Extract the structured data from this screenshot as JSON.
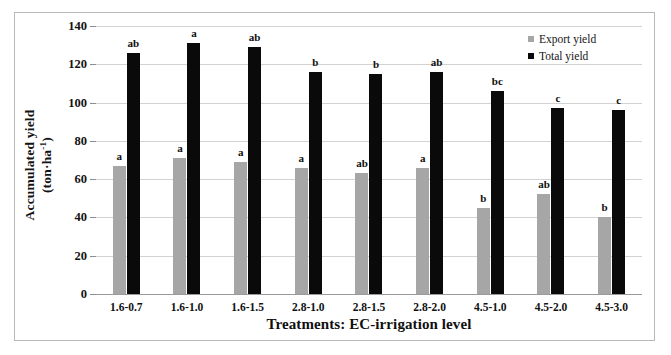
{
  "chart_data": {
    "type": "bar",
    "title": "",
    "xlabel": "Treatments: EC-irrigation level",
    "ylabel_line1": "Accumulated yield",
    "ylabel_line2": "(ton·ha",
    "ylabel_exp": "-1",
    "ylabel_line2_close": ")",
    "categories": [
      "1.6-0.7",
      "1.6-1.0",
      "1.6-1.5",
      "2.8-1.0",
      "2.8-1.5",
      "2.8-2.0",
      "4.5-1.0",
      "4.5-2.0",
      "4.5-3.0"
    ],
    "series": [
      {
        "name": "Export yield",
        "color": "#a6a6a6",
        "values": [
          67,
          71,
          69,
          66,
          63,
          66,
          45,
          52,
          40
        ],
        "letters": [
          "a",
          "a",
          "a",
          "a",
          "ab",
          "a",
          "b",
          "ab",
          "b"
        ]
      },
      {
        "name": "Total yield",
        "color": "#0a0a0a",
        "values": [
          126,
          131,
          129,
          116,
          115,
          116,
          106,
          97,
          96
        ],
        "letters": [
          "ab",
          "a",
          "ab",
          "b",
          "b",
          "ab",
          "bc",
          "c",
          "c"
        ]
      }
    ],
    "yticks": [
      0,
      20,
      40,
      60,
      80,
      100,
      120,
      140
    ],
    "ylim": [
      0,
      140
    ],
    "grid": true,
    "legend_position": "top-right"
  }
}
